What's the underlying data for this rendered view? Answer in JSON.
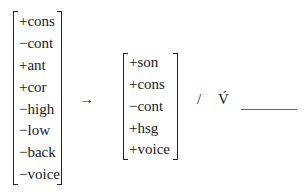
{
  "rule": {
    "input": [
      "+cons",
      "−cont",
      "+ant",
      "+cor",
      "−high",
      "−low",
      "−back",
      "−voice"
    ],
    "arrow": "→",
    "output": [
      "+son",
      "+cons",
      "−cont",
      "+hsg",
      "+voice"
    ],
    "slash": "/",
    "left_context": "V́",
    "right_context": "V"
  }
}
